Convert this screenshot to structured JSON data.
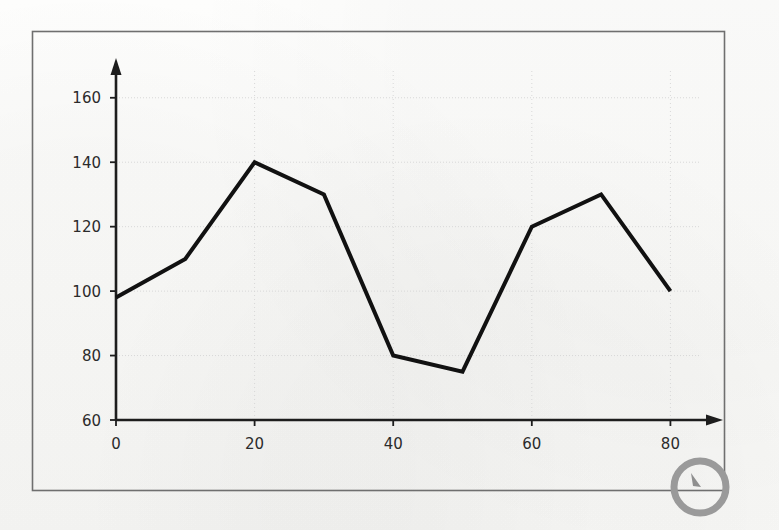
{
  "page": {
    "background_color": "#fdfdfb",
    "frame": {
      "name": "outer-frame-border",
      "color": "#6f6f6f",
      "x": 32,
      "y": 31,
      "width": 692,
      "height": 459
    }
  },
  "annotation": {
    "circle": {
      "label": "circle-highlight",
      "color": "#9a9a9a",
      "cx": 700,
      "cy": 487,
      "r": 26,
      "stroke_width": 7
    },
    "cursor_mark": {
      "label": "cursor-arrow-mark",
      "color": "#8f8f8f"
    }
  },
  "chart_data": {
    "type": "line",
    "title": "",
    "subtitle": "",
    "xlabel": "",
    "ylabel": "",
    "xlim": [
      0,
      86
    ],
    "ylim": [
      60,
      168
    ],
    "xticks": [
      0,
      20,
      40,
      60,
      80
    ],
    "xtick_labels": [
      "0",
      "20",
      "40",
      "60",
      "80"
    ],
    "yticks": [
      60,
      80,
      100,
      120,
      140,
      160
    ],
    "ytick_labels": [
      "60",
      "80",
      "100",
      "120",
      "140",
      "160"
    ],
    "grid": true,
    "grid_color": "#d8d8d8",
    "legend": null,
    "legend_position": "none",
    "axis_arrows": true,
    "axis_color": "#1d1d1d",
    "line_color": "#111111",
    "line_width": 4,
    "markers": false,
    "x": [
      0,
      10,
      20,
      30,
      40,
      50,
      60,
      70,
      80
    ],
    "values": [
      98,
      110,
      140,
      130,
      80,
      75,
      120,
      130,
      100
    ],
    "series": [
      {
        "name": "series-1",
        "x": [
          0,
          10,
          20,
          30,
          40,
          50,
          60,
          70,
          80
        ],
        "values": [
          98,
          110,
          140,
          130,
          80,
          75,
          120,
          130,
          100
        ]
      }
    ]
  }
}
